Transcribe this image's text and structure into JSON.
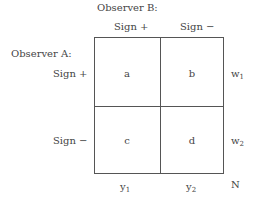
{
  "observer_b": {
    "label": "Observer B:",
    "columns": [
      "Sign +",
      "Sign −"
    ]
  },
  "observer_a": {
    "label": "Observer A:",
    "rows": [
      "Sign +",
      "Sign −"
    ]
  },
  "cells": {
    "a": "a",
    "b": "b",
    "c": "c",
    "d": "d"
  },
  "row_totals": [
    {
      "base": "w",
      "sub": "1"
    },
    {
      "base": "w",
      "sub": "2"
    }
  ],
  "col_totals": [
    {
      "base": "y",
      "sub": "1"
    },
    {
      "base": "y",
      "sub": "2"
    }
  ],
  "grand_total": "N"
}
